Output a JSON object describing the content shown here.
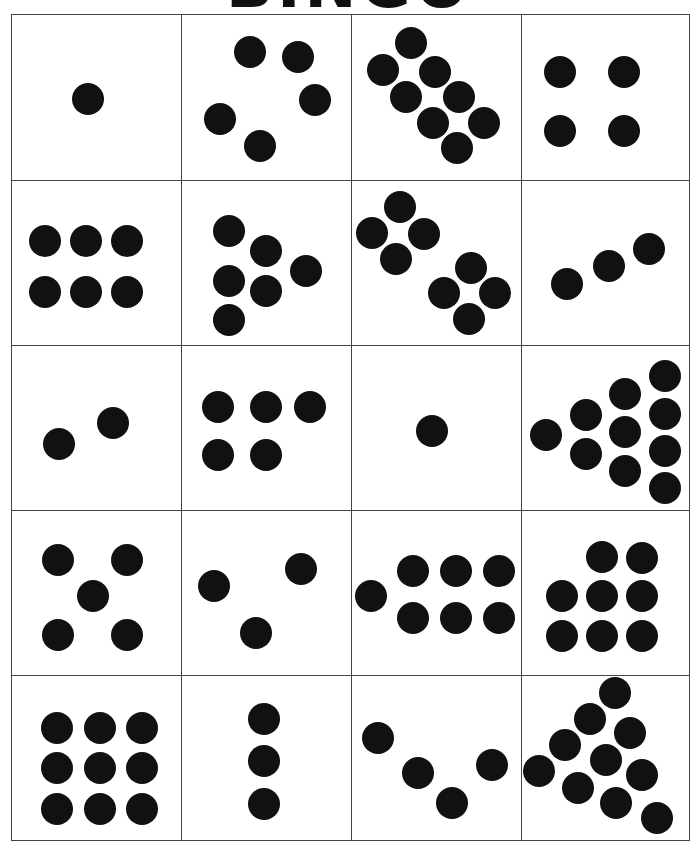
{
  "title": "BINGO",
  "dot_color": "#111111",
  "board": {
    "rows": 5,
    "columns": 4,
    "cells": [
      {
        "dots": 1
      },
      {
        "dots": 5
      },
      {
        "dots": 8
      },
      {
        "dots": 4
      },
      {
        "dots": 6
      },
      {
        "dots": 6
      },
      {
        "dots": 8
      },
      {
        "dots": 3
      },
      {
        "dots": 2
      },
      {
        "dots": 5
      },
      {
        "dots": 1
      },
      {
        "dots": 10
      },
      {
        "dots": 5
      },
      {
        "dots": 3
      },
      {
        "dots": 7
      },
      {
        "dots": 8
      },
      {
        "dots": 9
      },
      {
        "dots": 3
      },
      {
        "dots": 4
      },
      {
        "dots": 10
      }
    ]
  }
}
